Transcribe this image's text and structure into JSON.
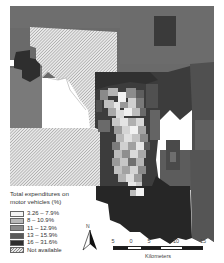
{
  "map": {
    "type": "choropleth",
    "subject": "Total expenditures on motor vehicles by area",
    "colors": {
      "class1": "#f4f4f4",
      "class2": "#b8b8b8",
      "class3": "#8a8a8a",
      "class4": "#5a5a5a",
      "class5": "#2e2e2e",
      "not_available": "hatched"
    }
  },
  "legend": {
    "title_line1": "Total expenditures on",
    "title_line2": "motor vehicles (%)",
    "items": [
      {
        "label": "3.26 – 7.9%",
        "color": "#f4f4f4"
      },
      {
        "label": "8 – 10.9%",
        "color": "#b8b8b8"
      },
      {
        "label": "11 – 12.9%",
        "color": "#8a8a8a"
      },
      {
        "label": "13 – 15.9%",
        "color": "#5a5a5a"
      },
      {
        "label": "16 – 31.6%",
        "color": "#2e2e2e"
      },
      {
        "label": "Not available",
        "color": "hatched"
      }
    ]
  },
  "north_arrow": {
    "label": "N"
  },
  "scale_bar": {
    "ticks": [
      "5",
      "0",
      "5",
      "10",
      "15"
    ],
    "unit": "Kilometers"
  }
}
